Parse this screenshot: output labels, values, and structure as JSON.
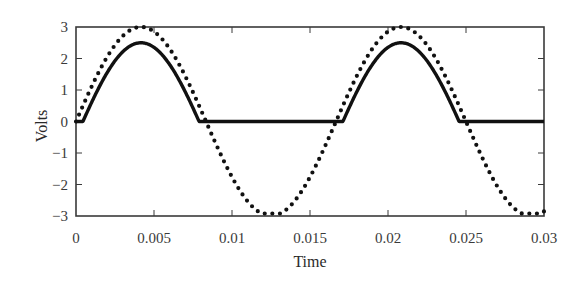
{
  "chart_data": {
    "type": "line",
    "title": "",
    "xlabel": "Time",
    "ylabel": "Volts",
    "xlim": [
      0,
      0.03
    ],
    "ylim": [
      -3,
      3
    ],
    "grid": false,
    "legend": null,
    "x_ticks": [
      0,
      0.005,
      0.01,
      0.015,
      0.02,
      0.025,
      0.03
    ],
    "x_tick_labels": [
      "0",
      "0.005",
      "0.01",
      "0.015",
      "0.02",
      "0.025",
      "0.03"
    ],
    "y_ticks": [
      3,
      2,
      1,
      0,
      -1,
      -2,
      -3
    ],
    "y_tick_labels": [
      "3",
      "2",
      "1",
      "0",
      "−1",
      "−2",
      "−3"
    ],
    "series": [
      {
        "name": "input",
        "style": "dotted",
        "description": "Sine wave, amplitude ~3 V, frequency ~60 Hz",
        "amplitude": 3,
        "frequency_hz": 60,
        "x": [
          0,
          0.0021,
          0.0042,
          0.0063,
          0.0083,
          0.0104,
          0.0125,
          0.0146,
          0.0167,
          0.0188,
          0.0208,
          0.0229,
          0.025,
          0.0271,
          0.0292,
          0.03
        ],
        "values": [
          0,
          2.12,
          3.0,
          2.12,
          0.0,
          -2.12,
          -3.0,
          -2.12,
          0.0,
          2.12,
          3.0,
          2.12,
          0.0,
          -2.12,
          -3.0,
          -2.9
        ]
      },
      {
        "name": "output",
        "style": "solid",
        "description": "Half-wave rectified output with ~0.5 V diode drop: max(0, input - 0.5)",
        "offset": 0.5,
        "x": [
          0,
          0.0007,
          0.0021,
          0.0042,
          0.0063,
          0.0077,
          0.0083,
          0.0104,
          0.0125,
          0.0146,
          0.0167,
          0.0174,
          0.0188,
          0.0208,
          0.0229,
          0.0243,
          0.025,
          0.0271,
          0.0292,
          0.03
        ],
        "values": [
          0,
          0,
          1.62,
          2.5,
          1.62,
          0,
          0,
          0,
          0,
          0,
          0,
          0,
          1.62,
          2.5,
          1.62,
          0,
          0,
          0,
          0,
          0
        ]
      }
    ]
  }
}
